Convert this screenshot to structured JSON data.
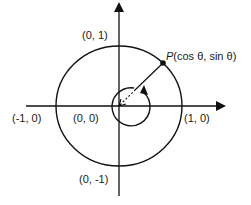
{
  "diagram": {
    "labels": {
      "top": "(0, 1)",
      "bottom": "(0, -1)",
      "left": "(-1, 0)",
      "right": "(1, 0)",
      "origin": "(0, 0)",
      "point_p_letter": "P",
      "point_p_coords": "(cos  θ, sin  θ)"
    },
    "colors": {
      "stroke": "#111111",
      "background": "#ffffff"
    }
  }
}
